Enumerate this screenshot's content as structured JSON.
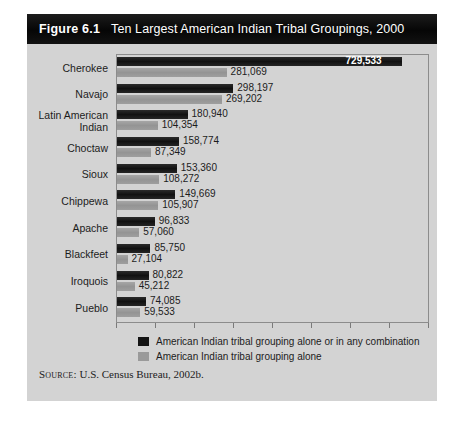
{
  "figure": {
    "number": "Figure 6.1",
    "title": "Ten Largest American Indian Tribal Groupings, 2000",
    "source_label": "Source:",
    "source_text": "U.S. Census Bureau, 2002b."
  },
  "chart_data": {
    "type": "bar",
    "orientation": "horizontal",
    "title": "Ten Largest American Indian Tribal Groupings, 2000",
    "xlabel": "",
    "ylabel": "",
    "grid": false,
    "legend_position": "bottom-left",
    "xlim": [
      0,
      800000
    ],
    "tick_interval": 100000,
    "categories": [
      "Cherokee",
      "Navajo",
      "Latin American Indian",
      "Choctaw",
      "Sioux",
      "Chippewa",
      "Apache",
      "Blackfeet",
      "Iroquois",
      "Pueblo"
    ],
    "category_lines": [
      [
        "Cherokee"
      ],
      [
        "Navajo"
      ],
      [
        "Latin American",
        "Indian"
      ],
      [
        "Choctaw"
      ],
      [
        "Sioux"
      ],
      [
        "Chippewa"
      ],
      [
        "Apache"
      ],
      [
        "Blackfeet"
      ],
      [
        "Iroquois"
      ],
      [
        "Pueblo"
      ]
    ],
    "series": [
      {
        "name": "American Indian tribal grouping alone or in any combination",
        "color": "#141414",
        "values": [
          729533,
          298197,
          180940,
          158774,
          153360,
          149669,
          96833,
          85750,
          80822,
          74085
        ],
        "labels": [
          "729,533",
          "298,197",
          "180,940",
          "158,774",
          "153,360",
          "149,669",
          "96,833",
          "85,750",
          "80,822",
          "74,085"
        ]
      },
      {
        "name": "American Indian tribal grouping alone",
        "color": "#9a9a9a",
        "values": [
          281069,
          269202,
          104354,
          87349,
          108272,
          105907,
          57060,
          27104,
          45212,
          59533
        ],
        "labels": [
          "281,069",
          "269,202",
          "104,354",
          "87,349",
          "108,272",
          "105,907",
          "57,060",
          "27,104",
          "45,212",
          "59,533"
        ]
      }
    ]
  }
}
